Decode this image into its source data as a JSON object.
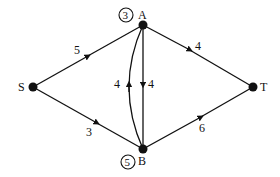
{
  "diagram": {
    "type": "network-flow-graph",
    "nodes": [
      {
        "id": "S",
        "label": "S",
        "x": 33,
        "y": 87
      },
      {
        "id": "A",
        "label": "A",
        "x": 143,
        "y": 25,
        "circled_value": "3"
      },
      {
        "id": "T",
        "label": "T",
        "x": 253,
        "y": 87
      },
      {
        "id": "B",
        "label": "B",
        "x": 143,
        "y": 149,
        "circled_value": "5"
      }
    ],
    "edges": [
      {
        "from": "S",
        "to": "A",
        "weight": "5"
      },
      {
        "from": "S",
        "to": "B",
        "weight": "3"
      },
      {
        "from": "A",
        "to": "T",
        "weight": "4"
      },
      {
        "from": "B",
        "to": "T",
        "weight": "6"
      },
      {
        "from": "A",
        "to": "B",
        "weight": "4",
        "shape": "straight"
      },
      {
        "from": "B",
        "to": "A",
        "weight": "4",
        "shape": "curved"
      }
    ],
    "colors": {
      "stroke": "#111111",
      "background": "#ffffff"
    }
  }
}
